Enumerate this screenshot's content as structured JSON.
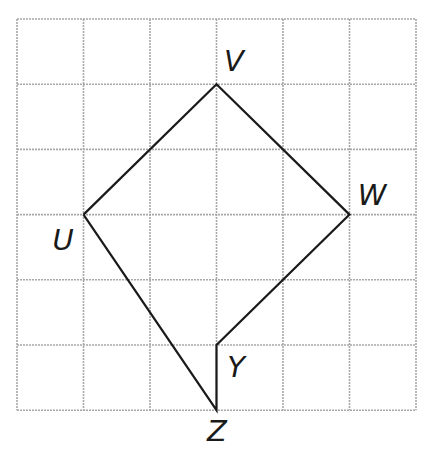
{
  "grid": {
    "columns": 6,
    "rows": 6,
    "origin_px": [
      17,
      19
    ],
    "cell_w": 66.5,
    "cell_h": 65.2,
    "line_color": "#a8a8a8",
    "stroke_color": "#1a1a1a"
  },
  "points": [
    {
      "name": "V",
      "col": 3,
      "row": 1,
      "label_px": [
        234,
        61
      ]
    },
    {
      "name": "W",
      "col": 5,
      "row": 3,
      "label_px": [
        372,
        195
      ]
    },
    {
      "name": "U",
      "col": 1,
      "row": 3,
      "label_px": [
        63,
        240
      ]
    },
    {
      "name": "Y",
      "col": 3,
      "row": 5,
      "label_px": [
        236,
        367
      ]
    },
    {
      "name": "Z",
      "col": 3,
      "row": 6,
      "label_px": [
        217,
        431
      ]
    }
  ],
  "segments": [
    [
      "U",
      "V"
    ],
    [
      "V",
      "W"
    ],
    [
      "W",
      "Y"
    ],
    [
      "Y",
      "Z"
    ],
    [
      "Z",
      "U"
    ]
  ],
  "labels": {
    "V": "V",
    "W": "W",
    "U": "U",
    "Y": "Y",
    "Z": "Z"
  }
}
